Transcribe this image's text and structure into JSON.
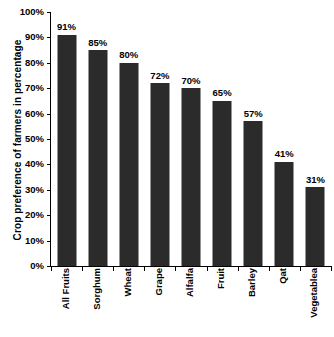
{
  "chart_data": {
    "type": "bar",
    "title": "",
    "subtitle": "",
    "xlabel": "",
    "ylabel": "Crop preference of farmers in percentage",
    "categories": [
      "All Fruits",
      "Sorghum",
      "Wheat",
      "Grape",
      "Alfalfa",
      "Fruit",
      "Barley",
      "Qat",
      "Vegetablea"
    ],
    "values": [
      91,
      85,
      80,
      72,
      70,
      65,
      57,
      41,
      31
    ],
    "value_labels": [
      "91%",
      "85%",
      "80%",
      "72%",
      "70%",
      "65%",
      "57%",
      "41%",
      "31%"
    ],
    "ylim": [
      0,
      100
    ],
    "ytick_values": [
      0,
      10,
      20,
      30,
      40,
      50,
      60,
      70,
      80,
      90,
      100
    ],
    "ytick_labels": [
      "0%",
      "10%",
      "20%",
      "30%",
      "40%",
      "50%",
      "60%",
      "70%",
      "80%",
      "90%",
      "100%"
    ],
    "grid": false,
    "legend": false,
    "legend_position": "none",
    "bar_color": "#2b2b2b",
    "axis_color": "#000000",
    "background_color": "#ffffff"
  }
}
